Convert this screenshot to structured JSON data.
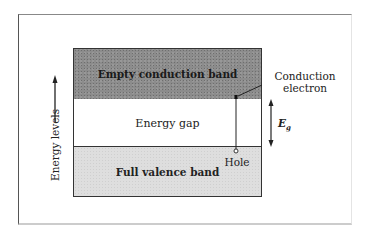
{
  "diagram": {
    "bands": {
      "conduction": "Empty conduction band",
      "gap": "Energy gap",
      "valence": "Full valence band"
    },
    "labels": {
      "conduction_electron_line1": "Conduction",
      "conduction_electron_line2": "electron",
      "hole": "Hole",
      "energy_gap_symbol": "E",
      "energy_gap_subscript": "g",
      "axis": "Energy levels"
    },
    "colors": {
      "conduction_band": "#8c8c8c",
      "valence_band": "#dedede",
      "gap": "#ffffff",
      "lines": "#222222"
    }
  }
}
